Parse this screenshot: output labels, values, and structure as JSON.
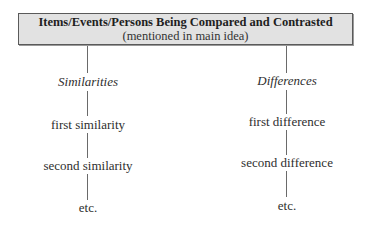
{
  "header": {
    "title": "Items/Events/Persons Being Compared and Contrasted",
    "subtitle": "(mentioned in main idea)"
  },
  "columns": [
    {
      "heading": "Similarities",
      "items": [
        "first similarity",
        "second similarity",
        "etc."
      ]
    },
    {
      "heading": "Differences",
      "items": [
        "first difference",
        "second difference",
        "etc."
      ]
    }
  ]
}
